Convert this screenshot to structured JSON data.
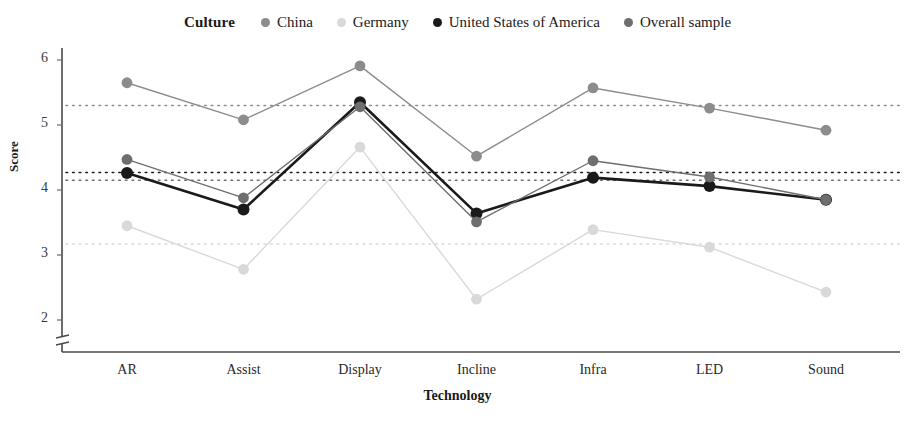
{
  "legend": {
    "title": "Culture",
    "items": [
      {
        "label": "China",
        "color": "#8c8c8c"
      },
      {
        "label": "Germany",
        "color": "#d9d9d9"
      },
      {
        "label": "United States of America",
        "color": "#1a1a1a"
      },
      {
        "label": "Overall sample",
        "color": "#6e6e6e"
      }
    ]
  },
  "chart_data": {
    "type": "line",
    "title": "",
    "xlabel": "Technology",
    "ylabel": "Score",
    "categories": [
      "AR",
      "Assist",
      "Display",
      "Incline",
      "Infra",
      "LED",
      "Sound"
    ],
    "ylim": [
      1.8,
      6.2
    ],
    "yticks": [
      2,
      3,
      4,
      5,
      6
    ],
    "grid": false,
    "legend_position": "top-center",
    "series": [
      {
        "name": "China",
        "color": "#8c8c8c",
        "reference_line": 5.3,
        "values": [
          5.65,
          5.08,
          5.91,
          4.52,
          5.57,
          5.26,
          4.92
        ]
      },
      {
        "name": "Germany",
        "color": "#d9d9d9",
        "reference_line": 3.17,
        "values": [
          3.45,
          2.78,
          4.66,
          2.32,
          3.39,
          3.12,
          2.43
        ]
      },
      {
        "name": "United States of America",
        "color": "#1a1a1a",
        "reference_line": 4.27,
        "values": [
          4.26,
          3.7,
          5.35,
          3.64,
          4.19,
          4.06,
          3.85
        ]
      },
      {
        "name": "Overall sample",
        "color": "#6e6e6e",
        "reference_line": 4.15,
        "values": [
          4.47,
          3.88,
          5.28,
          3.51,
          4.45,
          4.2,
          3.85
        ]
      }
    ]
  }
}
